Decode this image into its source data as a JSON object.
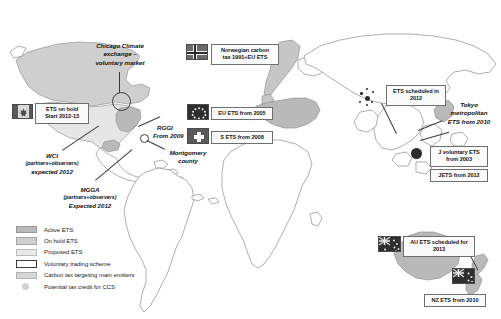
{
  "figure": {
    "name": "world-map-carbon-pricing",
    "background": "#ffffff"
  },
  "colors": {
    "active_ets": "#b9b9b9",
    "on_hold_ets": "#cfcfcf",
    "proposed_ets": "#e8e8e8",
    "voluntary_scheme_border": "#3d3d3d",
    "carbon_tax": "#d6d6d6",
    "ccs_credit": "#d3d3d3",
    "coastline": "#8d8d8d",
    "label_text": "#161616"
  },
  "legend": {
    "name": "map-legend",
    "items": [
      {
        "swatch": "active-ets-swatch",
        "label": "Active ETS"
      },
      {
        "swatch": "on-hold-ets-swatch",
        "label": "On hold ETS"
      },
      {
        "swatch": "proposed-ets-swatch",
        "label": "Proposed ETS"
      },
      {
        "swatch": "voluntary-scheme-swatch",
        "label": "Voluntary trading scheme"
      },
      {
        "swatch": "carbon-tax-swatch",
        "label": "Carbon tax targeting main emitters"
      },
      {
        "swatch": "ccs-credit-swatch",
        "label": "Potential tax credit for CCS"
      }
    ]
  },
  "callouts": {
    "canada": {
      "name": "callout-canada",
      "flag": "canada-flag",
      "lines": [
        "ETS on hold",
        "Start 2012-13"
      ]
    },
    "norway": {
      "name": "callout-norway",
      "flag": "norway-flag",
      "lines": [
        "Norwegian carbon",
        "tax 1991+EU ETS"
      ]
    },
    "eu": {
      "name": "callout-eu",
      "flag": "eu-flag",
      "lines": [
        "EU ETS from 2005"
      ]
    },
    "switzerland": {
      "name": "callout-switzerland",
      "flag": "swiss-flag",
      "lines": [
        "S ETS from 2008"
      ]
    },
    "china": {
      "name": "callout-china",
      "lines": [
        "ETS scheduled in",
        "2012"
      ]
    },
    "japan_voluntary": {
      "name": "callout-japan-voluntary",
      "lines": [
        "J voluntary ETS",
        "from 2003"
      ]
    },
    "jets": {
      "name": "callout-jets",
      "lines": [
        "JETS from 2012"
      ]
    },
    "australia": {
      "name": "callout-australia",
      "flag": "australia-flag",
      "lines": [
        "AU ETS scheduled for",
        "2013"
      ]
    },
    "new_zealand": {
      "name": "callout-new-zealand",
      "flag": "new-zealand-flag",
      "lines": [
        "NZ ETS from 2010"
      ]
    }
  },
  "plain_labels": {
    "chicago": {
      "name": "label-chicago-climate-exchange",
      "lines": [
        "Chicago Climate",
        "exchange –",
        "voluntary market"
      ]
    },
    "rggi": {
      "name": "label-rggi",
      "lines": [
        "RGGI",
        "From 2009"
      ]
    },
    "montgomery": {
      "name": "label-montgomery-county",
      "lines": [
        "Montgomery",
        "county"
      ]
    },
    "wci": {
      "name": "label-wci",
      "lines": [
        "WCI",
        "(partners+observers)",
        "expected 2012"
      ]
    },
    "mgga": {
      "name": "label-mgga",
      "lines": [
        "MGGA",
        "(partners+observers)",
        "Expected 2012"
      ]
    },
    "tokyo": {
      "name": "label-tokyo-metropolitan",
      "lines": [
        "Tokyo",
        "metropolitan",
        "ETS from 2010"
      ]
    }
  }
}
